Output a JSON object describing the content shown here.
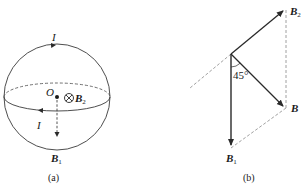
{
  "figure_a": {
    "caption": "(a)",
    "center_label": "O",
    "current_top_label": "I",
    "current_bottom_label": "I",
    "field_into_page_symbol": "⊗",
    "b2_label_main": "B",
    "b2_label_sub": "2",
    "b1_label_main": "B",
    "b1_label_sub": "1"
  },
  "figure_b": {
    "caption": "(b)",
    "angle_label": "45°",
    "b2_label_main": "B",
    "b2_label_sub": "2",
    "b_label": "B",
    "b1_label_main": "B",
    "b1_label_sub": "1"
  },
  "colors": {
    "stroke": "#2a2a2a",
    "dashed": "#777777",
    "background": "#ffffff"
  }
}
